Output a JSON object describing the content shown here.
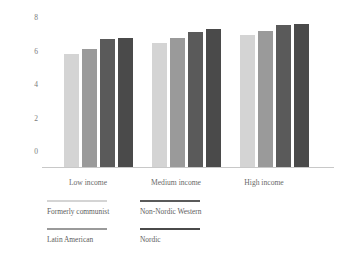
{
  "chart_data": {
    "type": "bar",
    "title": "",
    "xlabel": "",
    "ylabel": "",
    "ylim": [
      0,
      8.8
    ],
    "grid": false,
    "legend_position": "bottom-left",
    "categories": [
      "Low income",
      "Medium income",
      "High income"
    ],
    "yticks": [
      "0",
      "2",
      "4",
      "6",
      "8"
    ],
    "ytick_values": [
      0,
      2,
      4,
      6,
      8
    ],
    "series": [
      {
        "name": "Formerly communist",
        "color": "#d4d4d4",
        "values": [
          6.65,
          7.3,
          7.75
        ]
      },
      {
        "name": "Latin American",
        "color": "#9a9a9a",
        "values": [
          6.9,
          7.55,
          8.0
        ]
      },
      {
        "name": "Non-Nordic Western",
        "color": "#5a5a5a",
        "values": [
          7.5,
          7.9,
          8.35
        ]
      },
      {
        "name": "Nordic",
        "color": "#4a4a4a",
        "values": [
          7.55,
          8.1,
          8.4
        ]
      }
    ]
  },
  "axis": {
    "tick_0": "0",
    "tick_2": "2",
    "tick_4": "4",
    "tick_6": "6",
    "tick_8": "8"
  },
  "categories": {
    "low": "Low income",
    "medium": "Medium income",
    "high": "High income"
  },
  "legend": {
    "entries": [
      {
        "label": "Formerly communist",
        "color": "#d4d4d4"
      },
      {
        "label": "Non-Nordic Western",
        "color": "#5a5a5a"
      },
      {
        "label": "Latin American",
        "color": "#9a9a9a"
      },
      {
        "label": "Nordic",
        "color": "#4a4a4a"
      }
    ]
  }
}
